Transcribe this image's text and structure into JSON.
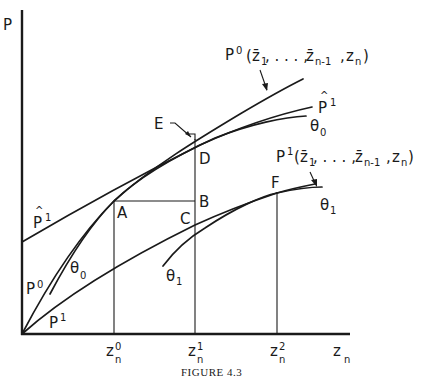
{
  "figure": {
    "caption": "FIGURE 4.3",
    "axes": {
      "y_label": "P",
      "x_label_main": "z",
      "x_label_sub": "n",
      "x_ticks": [
        {
          "main": "z",
          "sup": "0",
          "sub": "n"
        },
        {
          "main": "z",
          "sup": "1",
          "sub": "n"
        },
        {
          "main": "z",
          "sup": "2",
          "sub": "n"
        }
      ]
    },
    "points": {
      "A": "A",
      "B": "B",
      "C": "C",
      "D": "D",
      "E": "E",
      "F": "F"
    },
    "curves": {
      "p0_function": {
        "main": "P",
        "sup": "0",
        "args": "(z̄₁, . . . , z̄ₙ₋₁, zₙ)",
        "args_pre": "(",
        "z1": "z̄",
        "z1_sub": "1",
        "dots": ", . . . , ",
        "zn1": "z̄",
        "zn1_sub": "n-1",
        "comma": ",",
        "zn": "z",
        "zn_sub": "n",
        "args_post": ")"
      },
      "p1_function": {
        "main": "P",
        "sup": "1",
        "args_pre": "(",
        "z1": "z̄",
        "z1_sub": "1",
        "dots": ", . . . , ",
        "zn1": "z̄",
        "zn1_sub": "n-1",
        "comma": ",",
        "zn": "z",
        "zn_sub": "n",
        "args_post": ")"
      },
      "p_hat_1": {
        "main": "P",
        "hat": "^",
        "sup": "1"
      },
      "theta_0": {
        "main": "θ",
        "sub": "0"
      },
      "theta_1": {
        "main": "θ",
        "sub": "1"
      },
      "p0": {
        "main": "P",
        "sup": "0"
      },
      "p1": {
        "main": "P",
        "sup": "1"
      }
    },
    "colors": {
      "ink": "#1a1a1a",
      "background": "#ffffff"
    }
  }
}
